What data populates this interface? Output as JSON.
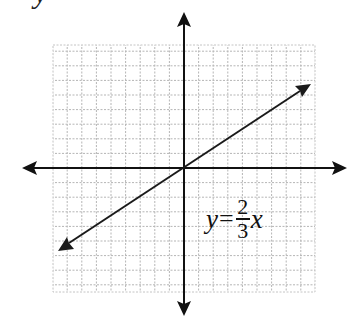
{
  "figure": {
    "cropped_glyph": "y",
    "equation": {
      "lhs": "y",
      "equals": "=",
      "numerator": "2",
      "denominator": "3",
      "variable": "x"
    },
    "grid": {
      "cells_left": 9,
      "cells_right": 9,
      "cells_up": 8.5,
      "cells_down": 8.7,
      "style": "dotted"
    },
    "line": {
      "slope": "2/3",
      "intercept": 0,
      "arrows": "both"
    },
    "colors": {
      "axis": "#111111",
      "grid": "#b5b5b5",
      "line": "#1a1a1a",
      "background": "#ffffff"
    }
  }
}
